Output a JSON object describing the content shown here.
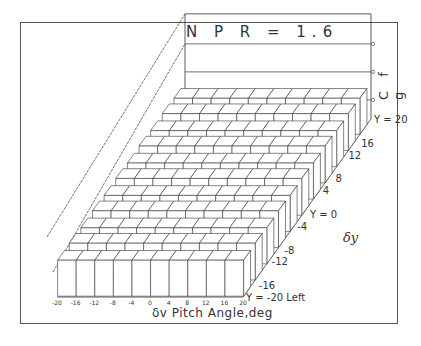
{
  "chart_data": {
    "type": "bar3d",
    "title": "N P R = 1.6",
    "xlabel": "δv  Pitch Angle,deg",
    "ylabel": "δy",
    "zlabel": "C f g",
    "x_ticks": [
      "-20",
      "-16",
      "-12",
      "-8",
      "-4",
      "0",
      "4",
      "8",
      "12",
      "16",
      "20"
    ],
    "y_ticks": [
      "Y = -20 Left",
      "-16",
      "-12",
      "-8",
      "-4",
      "Y = 0",
      "4",
      "8",
      "12",
      "16",
      "Y = 20"
    ],
    "x": [
      -20,
      -16,
      -12,
      -8,
      -4,
      0,
      4,
      8,
      12,
      16,
      20
    ],
    "y": [
      -20,
      -16,
      -12,
      -8,
      -4,
      0,
      4,
      8,
      12,
      16,
      20
    ],
    "zlim_note": "Cfg axis ticks unlabeled; bar heights appear nearly uniform across pitch and yaw angles",
    "z_relative": [
      [
        1.0,
        1.0,
        1.0,
        1.0,
        1.0,
        1.0,
        1.0,
        1.0,
        1.0,
        1.0
      ],
      [
        1.0,
        1.0,
        1.0,
        1.0,
        1.0,
        1.0,
        1.0,
        1.0,
        1.0,
        1.0
      ],
      [
        1.0,
        1.0,
        1.0,
        1.0,
        1.0,
        1.0,
        1.0,
        1.0,
        1.0,
        1.0
      ],
      [
        1.0,
        1.0,
        1.0,
        1.0,
        1.0,
        1.0,
        1.0,
        1.0,
        1.0,
        1.0
      ],
      [
        1.0,
        1.0,
        1.0,
        1.0,
        1.0,
        1.0,
        1.0,
        1.0,
        1.0,
        1.0
      ],
      [
        1.0,
        1.0,
        1.0,
        1.0,
        1.0,
        1.0,
        1.0,
        1.0,
        1.0,
        1.0
      ],
      [
        1.0,
        1.0,
        1.0,
        1.0,
        1.0,
        1.0,
        1.0,
        1.0,
        1.0,
        1.0
      ],
      [
        1.0,
        1.0,
        1.0,
        1.0,
        1.0,
        1.0,
        1.0,
        1.0,
        1.0,
        1.0
      ],
      [
        1.0,
        1.0,
        1.0,
        1.0,
        1.0,
        1.0,
        1.0,
        1.0,
        1.0,
        1.0
      ],
      [
        1.0,
        1.0,
        1.0,
        1.0,
        1.0,
        1.0,
        1.0,
        1.0,
        1.0,
        1.0
      ],
      [
        1.0,
        1.0,
        1.0,
        1.0,
        1.0,
        1.0,
        1.0,
        1.0,
        1.0,
        1.0
      ]
    ],
    "grid": false,
    "legend": "none"
  },
  "colors": {
    "line": "#333333",
    "face": "#ffffff",
    "frame": "#555555"
  }
}
